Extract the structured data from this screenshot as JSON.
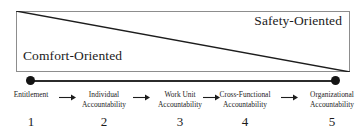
{
  "figure": {
    "box": {
      "top_right_label": "Safety-Oriented",
      "bottom_left_label": "Comfort-Oriented"
    }
  },
  "axis": {
    "start_marker": "dot",
    "end_marker": "dot",
    "arrow_glyph": "right-arrow"
  },
  "stages": [
    {
      "number": "1",
      "label": "Entitlement",
      "center_x": 31,
      "width": 52
    },
    {
      "number": "2",
      "label": "Individual\nAccountability",
      "center_x": 104,
      "width": 58
    },
    {
      "number": "3",
      "label": "Work Unit\nAccountability",
      "center_x": 180,
      "width": 58
    },
    {
      "number": "4",
      "label": "Cross-Functional\nAccountability",
      "center_x": 245,
      "width": 62
    },
    {
      "number": "5",
      "label": "Organizational\nAccountability",
      "center_x": 332,
      "width": 60
    }
  ],
  "arrows": [
    {
      "center_x": 68,
      "glyph": "right-arrow"
    },
    {
      "center_x": 142,
      "glyph": "right-arrow"
    },
    {
      "center_x": 212,
      "glyph": "right-arrow"
    },
    {
      "center_x": 290,
      "glyph": "right-arrow"
    }
  ],
  "colors": {
    "box_border": "#8d8d8d",
    "diagonal_line": "#1d1d1d",
    "axis_line": "#2b2b2b",
    "dot": "#141414",
    "text": "#1b1b1b",
    "background": "#ffffff"
  },
  "chart_data": {
    "type": "diagram",
    "categories": [
      "Entitlement",
      "Individual Accountability",
      "Work Unit Accountability",
      "Cross-Functional Accountability",
      "Organizational Accountability"
    ],
    "values": [
      1,
      2,
      3,
      4,
      5
    ],
    "xlabel": "",
    "ylabel": "",
    "annotations": [
      "Comfort-Oriented",
      "Safety-Oriented"
    ]
  }
}
